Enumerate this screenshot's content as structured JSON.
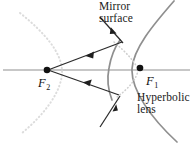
{
  "figure": {
    "kind": "optics-ray-diagram",
    "title_alt": "Hyperbolic mirror and lens ray diagram with foci F1 and F2",
    "width": 193,
    "height": 143,
    "background_color": "#ffffff",
    "labels": {
      "mirror_surface": "Mirror\nsurface",
      "hyperbolic_lens": "Hyperbolic\nlens",
      "focus_right_letter": "F",
      "focus_right_subscript": "1",
      "focus_left_letter": "F",
      "focus_left_subscript": "2"
    },
    "colors": {
      "ray_stroke": "#2b2b2b",
      "curve_solid_stroke": "#8b8b8b",
      "curve_dotted_stroke": "#d6d6d6",
      "mirror_dotted_stroke": "#c9c9c9",
      "axis_stroke": "#b4b4b4",
      "focus_dot_fill": "#111111",
      "text_color": "#1a1a1a"
    },
    "points": {
      "focus_left": {
        "x": 47,
        "y": 70,
        "radius": 3.2
      },
      "focus_right": {
        "x": 140,
        "y": 68,
        "radius": 3.2
      },
      "mirror_hit_upper": {
        "x": 122,
        "y": 42
      },
      "mirror_hit_lower": {
        "x": 119,
        "y": 95
      }
    },
    "axis": {
      "x1": 3,
      "y1": 70,
      "x2": 190,
      "y2": 70,
      "stroke_width": 1.4
    },
    "curves": {
      "hyperbola_right_branch_solid": "M 173 2 C 152 26 132 50 131 69 C 130 90 150 118 176 141",
      "hyperbola_left_branch_dotted": "M 20 14 C 44 34 60 52 61 70 C 62 90 45 114 22 133",
      "mirror_surface_solid": "M 110 88 C 110 80 110 58 118 42",
      "mirror_inner_dotted": "M 113 41 C 126 52 135 62 138 69 C 137 78 128 88 116 97"
    },
    "rays": [
      {
        "name": "reflected-ray-upper",
        "x1": 122,
        "y1": 42,
        "x2": 47,
        "y2": 70,
        "arrow_t": 0.52,
        "arrow_dir": "to-focus-left"
      },
      {
        "name": "reflected-ray-lower",
        "x1": 119,
        "y1": 95,
        "x2": 47,
        "y2": 70,
        "arrow_t": 0.56,
        "arrow_dir": "to-focus-left"
      },
      {
        "name": "incident-ray-upper",
        "x1": 101,
        "y1": 18,
        "x2": 122,
        "y2": 42,
        "arrow_t": 0.62,
        "arrow_dir": "to-mirror"
      },
      {
        "name": "incident-ray-lower",
        "x1": 101,
        "y1": 126,
        "x2": 119,
        "y2": 95,
        "arrow_t": 0.58,
        "arrow_dir": "to-mirror"
      }
    ]
  }
}
